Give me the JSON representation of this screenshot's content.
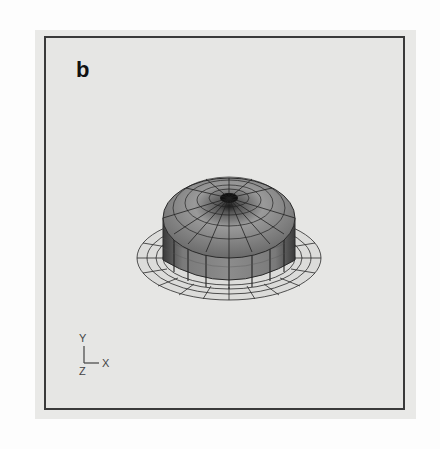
{
  "figure": {
    "panel_label": "b",
    "axes": {
      "y": "Y",
      "x": "X",
      "z": "Z"
    },
    "colors": {
      "background": "#e6e6e4",
      "frame": "#3a3a3a",
      "mesh": "#2a2a2a",
      "shading": "#6a6a6a"
    }
  }
}
